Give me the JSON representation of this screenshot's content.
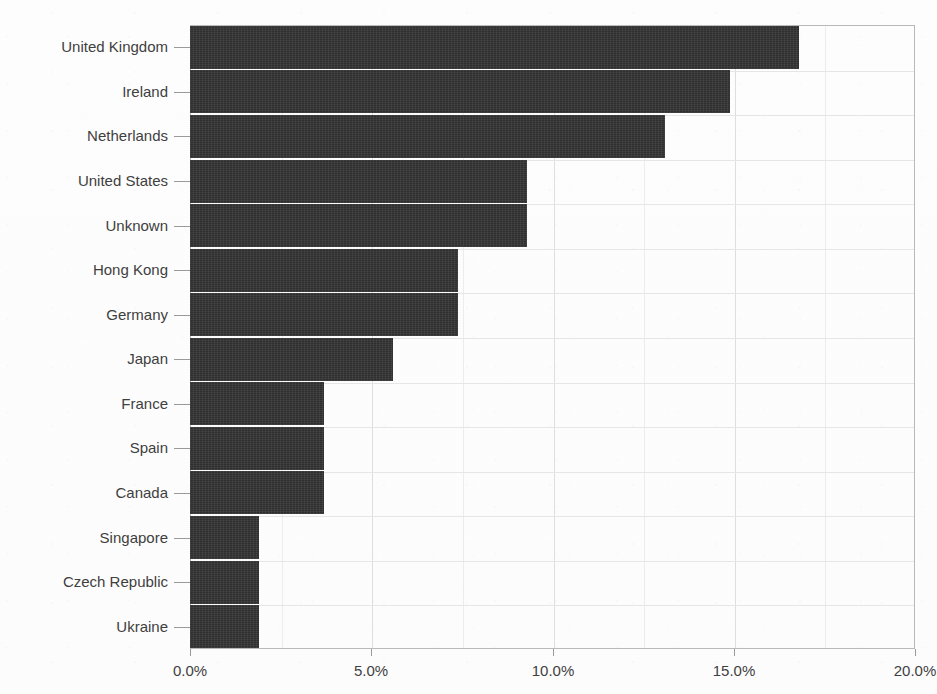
{
  "chart_data": {
    "type": "bar",
    "orientation": "horizontal",
    "title": "",
    "subtitle": "",
    "xlabel": "",
    "ylabel": "",
    "xlim": [
      0,
      20
    ],
    "xtick_labels": [
      "0.0%",
      "5.0%",
      "10.0%",
      "15.0%",
      "20.0%"
    ],
    "xtick_values": [
      0,
      5,
      10,
      15,
      20
    ],
    "xtick_minor_values": [
      2.5,
      7.5,
      12.5,
      17.5
    ],
    "grid": true,
    "legend": false,
    "legend_position": "none",
    "unit": "%",
    "categories": [
      "United Kingdom",
      "Ireland",
      "Netherlands",
      "United States",
      "Unknown",
      "Hong Kong",
      "Germany",
      "Japan",
      "France",
      "Spain",
      "Canada",
      "Singapore",
      "Czech Republic",
      "Ukraine"
    ],
    "values": [
      16.8,
      14.9,
      13.1,
      9.3,
      9.3,
      7.4,
      7.4,
      5.6,
      3.7,
      3.7,
      3.7,
      1.9,
      1.9,
      1.9
    ],
    "series": [
      {
        "name": "share",
        "values": [
          16.8,
          14.9,
          13.1,
          9.3,
          9.3,
          7.4,
          7.4,
          5.6,
          3.7,
          3.7,
          3.7,
          1.9,
          1.9,
          1.9
        ]
      }
    ]
  },
  "style": {
    "bar_color": "#333333",
    "background_color": "#fdfdfd",
    "grid_color": "#e6e6e6",
    "axis_color": "#b9b9b9",
    "text_color": "#3f3f3f"
  }
}
